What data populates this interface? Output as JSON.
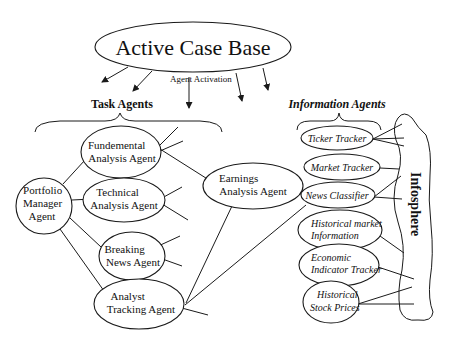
{
  "diagram": {
    "case_base": {
      "label": "Active Case Base"
    },
    "activation_label": "Agent Activation",
    "groups": {
      "task_agents": "Task Agents",
      "information_agents": "Information Agents"
    },
    "task_agents": {
      "portfolio": [
        "Portfolio",
        "Manager",
        "Agent"
      ],
      "fundemental": [
        "Fundemental",
        "Analysis Agent"
      ],
      "technical": [
        "Technical",
        "Analysis Agent"
      ],
      "breaking": [
        "Breaking",
        "News Agent"
      ],
      "analyst": [
        "Analyst",
        "Tracking Agent"
      ],
      "earnings": [
        "Earnings",
        "Analysis Agent"
      ]
    },
    "information_agents": {
      "ticker": [
        "Ticker Tracker"
      ],
      "market": [
        "Market Tracker"
      ],
      "news": [
        "News Classifier"
      ],
      "histmarket": [
        "Historical market",
        "Information"
      ],
      "economic": [
        "Economic",
        "Indicator Tracker"
      ],
      "stock": [
        "Historical",
        "Stock Prices"
      ]
    },
    "infosphere": {
      "label": "Infosphere"
    }
  }
}
